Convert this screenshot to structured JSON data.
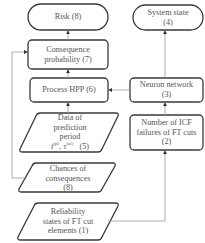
{
  "diagram": {
    "type": "flowchart",
    "nodes": [
      {
        "id": "n8_risk",
        "shape": "terminator",
        "lines": [
          "Risk  (8)"
        ]
      },
      {
        "id": "n7",
        "shape": "process",
        "lines": [
          "Consequence",
          "probability  (7)"
        ]
      },
      {
        "id": "n6",
        "shape": "process",
        "lines": [
          "Process HPP   (6)"
        ]
      },
      {
        "id": "n5",
        "shape": "data",
        "lines": [
          "Data of",
          "prediction",
          "period"
        ],
        "formula": {
          "a": "t",
          "a_sup": "(p)",
          "b": "τ",
          "b_sup": "(ai)",
          "suffix": "(5)"
        }
      },
      {
        "id": "n8_chances",
        "shape": "data",
        "lines": [
          "Chances of",
          "consequences",
          "(8)"
        ]
      },
      {
        "id": "n1",
        "shape": "data",
        "lines": [
          "Reliability",
          "states of FT cut",
          "elements   (1)"
        ]
      },
      {
        "id": "n4",
        "shape": "terminator",
        "lines": [
          "System state",
          "(4)"
        ]
      },
      {
        "id": "n3",
        "shape": "process",
        "lines": [
          "Neuron network",
          "(3)"
        ]
      },
      {
        "id": "n2",
        "shape": "process",
        "lines": [
          "Number of ICF",
          "failures of FT cuts",
          "(2)"
        ]
      }
    ],
    "edges": [
      {
        "from": "n7",
        "to": "n8_risk"
      },
      {
        "from": "n6",
        "to": "n7"
      },
      {
        "from": "n5",
        "to": "n6"
      },
      {
        "from": "n3",
        "to": "n6"
      },
      {
        "from": "n3",
        "to": "n4"
      },
      {
        "from": "n2",
        "to": "n3"
      },
      {
        "from": "n1",
        "to": "n2"
      },
      {
        "from": "n8_chances",
        "to": "n7"
      }
    ],
    "colors": {
      "stroke": "#3a3a3a",
      "connector": "#9a9a9a",
      "text": "#555555",
      "background": "#ffffff"
    }
  }
}
